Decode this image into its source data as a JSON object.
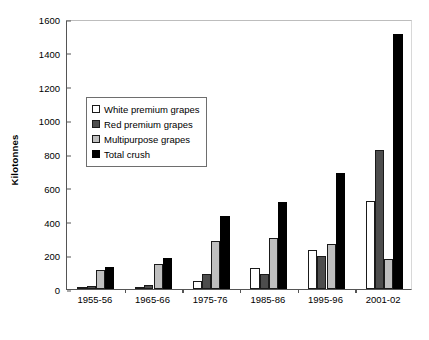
{
  "chart_data": {
    "type": "bar",
    "title": "",
    "xlabel": "",
    "ylabel": "Kilotonnes",
    "ylim": [
      0,
      1600
    ],
    "yticks": [
      0,
      200,
      400,
      600,
      800,
      1000,
      1200,
      1400,
      1600
    ],
    "grid": false,
    "legend_position": "inside-upper-left",
    "categories": [
      "1955-56",
      "1965-66",
      "1975-76",
      "1985-86",
      "1995-96",
      "2001-02"
    ],
    "series": [
      {
        "name": "White premium grapes",
        "color": "#ffffff",
        "values": [
          5,
          8,
          50,
          125,
          230,
          520
        ]
      },
      {
        "name": "Red premium grapes",
        "color": "#4d4d4d",
        "values": [
          15,
          25,
          90,
          90,
          195,
          825
        ]
      },
      {
        "name": "Multipurpose grapes",
        "color": "#bfbfbf",
        "values": [
          110,
          150,
          285,
          300,
          265,
          180
        ]
      },
      {
        "name": "Total crush",
        "color": "#000000",
        "values": [
          130,
          185,
          435,
          515,
          690,
          1510
        ]
      }
    ]
  },
  "axes": {
    "y_title": "Kilotonnes",
    "y_tick_labels": [
      "1600",
      "1400",
      "1200",
      "1000",
      "800",
      "600",
      "400",
      "200",
      "0"
    ],
    "x_tick_labels": [
      "1955-56",
      "1965-66",
      "1975-76",
      "1985-86",
      "1995-96",
      "2001-02"
    ]
  },
  "legend": {
    "entries": [
      {
        "label": "White premium grapes",
        "swatch": "white-outlined-square-icon"
      },
      {
        "label": "Red premium grapes",
        "swatch": "dark-gray-square-icon"
      },
      {
        "label": "Multipurpose grapes",
        "swatch": "light-gray-square-icon"
      },
      {
        "label": "Total crush",
        "swatch": "black-square-icon"
      }
    ]
  },
  "colors": {
    "white_premium": "#ffffff",
    "red_premium": "#4d4d4d",
    "multipurpose": "#bfbfbf",
    "total_crush": "#000000",
    "axis": "#555555",
    "background": "#ffffff"
  }
}
